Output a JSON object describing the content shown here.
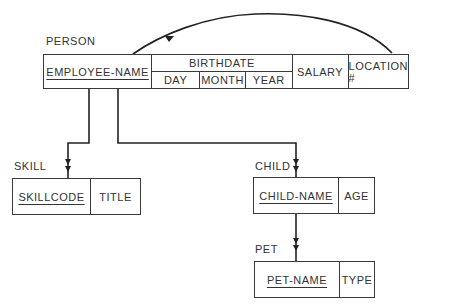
{
  "diagram": {
    "type": "hierarchical record structure",
    "records": {
      "person": {
        "name": "PERSON",
        "fields": {
          "employee_name": "EMPLOYEE-NAME",
          "birthdate": {
            "name": "BIRTHDATE",
            "parts": {
              "day": "DAY",
              "month": "MONTH",
              "year": "YEAR"
            }
          },
          "salary": "SALARY",
          "location": "LOCATION #"
        },
        "key": "EMPLOYEE-NAME"
      },
      "skill": {
        "name": "SKILL",
        "fields": {
          "skillcode": "SKILLCODE",
          "title": "TITLE"
        },
        "key": "SKILLCODE"
      },
      "child": {
        "name": "CHILD",
        "fields": {
          "child_name": "CHILD-NAME",
          "age": "AGE"
        },
        "key": "CHILD-NAME"
      },
      "pet": {
        "name": "PET",
        "fields": {
          "pet_name": "PET-NAME",
          "type": "TYPE"
        },
        "key": "PET-NAME"
      }
    },
    "links": [
      {
        "from": "PERSON",
        "to": "SKILL",
        "style": "double-arrow"
      },
      {
        "from": "PERSON",
        "to": "CHILD",
        "style": "double-arrow"
      },
      {
        "from": "CHILD",
        "to": "PET",
        "style": "double-arrow"
      },
      {
        "from": "LOCATION #",
        "to": "EMPLOYEE-NAME",
        "style": "curved-arrow"
      }
    ]
  }
}
